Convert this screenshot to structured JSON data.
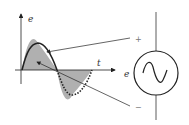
{
  "diagram": {
    "axis_y_label": "e",
    "axis_x_label": "t",
    "source_label": "e",
    "plus_sign": "+",
    "minus_sign": "−",
    "colors": {
      "fill": "#b0b0b0",
      "stroke": "#222222"
    }
  }
}
